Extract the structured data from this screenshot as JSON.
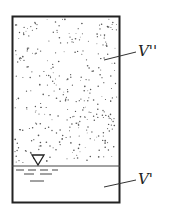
{
  "diagram": {
    "upper_region_label": "V''",
    "lower_region_label": "V'",
    "upper_region": "vapor / gas phase (stippled)",
    "lower_region": "liquid phase",
    "interface_marker": "liquid-level-triangle",
    "colors": {
      "line": "#222222",
      "dots": "#555555",
      "background": "#ffffff"
    }
  }
}
